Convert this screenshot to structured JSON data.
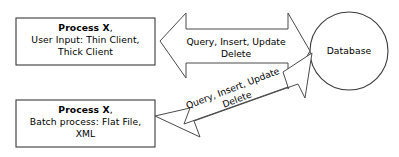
{
  "diagram": {
    "type": "flow-diagram",
    "background_color": "#ffffff",
    "line_color": "#4a4a4a",
    "text_color": "#000000",
    "nodes": [
      {
        "id": "process-x-user-input",
        "shape": "rectangle",
        "title": "Process X",
        "title_suffix": ",",
        "description_line1": "User Input: Thin Client,",
        "description_line2": "Thick Client"
      },
      {
        "id": "process-x-batch",
        "shape": "rectangle",
        "title": "Process X",
        "title_suffix": ",",
        "description_line1": "Batch process: Flat File,",
        "description_line2": "XML"
      },
      {
        "id": "database",
        "shape": "circle",
        "label": "Database"
      }
    ],
    "edges": [
      {
        "id": "edge-user-input-to-database",
        "from": "process-x-user-input",
        "to": "database",
        "direction": "bidirectional",
        "label_line1": "Query, Insert, Update",
        "label_line2": "Delete",
        "orientation": "horizontal"
      },
      {
        "id": "edge-batch-to-database",
        "from": "process-x-batch",
        "to": "database",
        "direction": "bidirectional",
        "label_line1": "Query, Insert, Update",
        "label_line2": "Delete",
        "orientation": "diagonal"
      }
    ]
  }
}
